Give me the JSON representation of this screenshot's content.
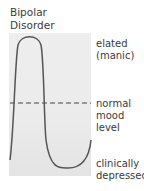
{
  "title": [
    "Bipolar",
    "Disorder"
  ],
  "labels": {
    "elated": [
      "elated",
      "(manic)"
    ],
    "normal": [
      "normal",
      "mood",
      "level"
    ],
    "depressed": [
      "clinically",
      "depressed"
    ]
  },
  "colors": {
    "panel": "#ebebeb",
    "curve": "#555555",
    "text": "#3a3a3a"
  }
}
